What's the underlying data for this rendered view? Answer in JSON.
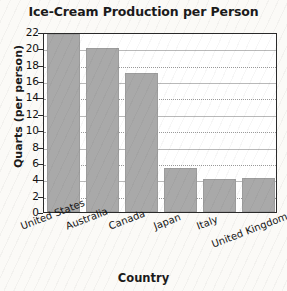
{
  "chart_data": {
    "type": "bar",
    "title": "Ice-Cream Production per Person",
    "xlabel": "Country",
    "ylabel": "Quarts (per person)",
    "categories": [
      "United States",
      "Australia",
      "Canada",
      "Japan",
      "Italy",
      "United Kingdom"
    ],
    "values": [
      21.8,
      20.0,
      17.0,
      5.4,
      4.0,
      4.2
    ],
    "ylim": [
      0,
      22
    ],
    "yticks": [
      22,
      20,
      18,
      16,
      14,
      12,
      10,
      8,
      6,
      4,
      2,
      0
    ],
    "grid": true,
    "legend": "none",
    "colors": {
      "bar_fill": "#a9a9a9",
      "bar_edge": "#9c9c9c",
      "frame": "#2a2a2a",
      "gridline": "#b9b9b9",
      "text": "#131313",
      "background": "#fbfaf7"
    }
  }
}
